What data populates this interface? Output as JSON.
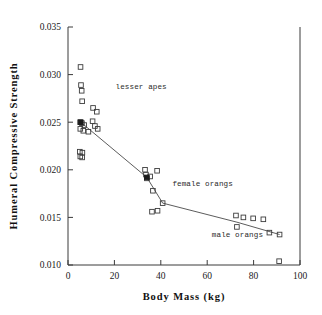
{
  "chart_data": {
    "type": "scatter",
    "title": "",
    "xlabel": "Body Mass (kg)",
    "ylabel": "Humeral Compressive Strength",
    "xlim": [
      0,
      100
    ],
    "ylim": [
      0.01,
      0.035
    ],
    "xticks": [
      0,
      20,
      40,
      60,
      80,
      100
    ],
    "yticks": [
      0.01,
      0.015,
      0.02,
      0.025,
      0.03,
      0.035
    ],
    "xticklabels": [
      "0",
      "20",
      "40",
      "60",
      "80",
      "100"
    ],
    "yticklabels": [
      "0.010",
      "0.015",
      "0.020",
      "0.025",
      "0.030",
      "0.035"
    ],
    "grid": false,
    "legend": null,
    "annotations": [
      {
        "text": "lesser apes",
        "x": 20.5,
        "y": 0.0285
      },
      {
        "text": "female orangs",
        "x": 45.0,
        "y": 0.0183
      },
      {
        "text": "male orangs",
        "x": 62.0,
        "y": 0.0129
      }
    ],
    "series": [
      {
        "name": "individual specimens",
        "marker": "open-square",
        "values": [
          [
            5.4,
            0.0308
          ],
          [
            5.6,
            0.0289
          ],
          [
            5.9,
            0.0283
          ],
          [
            6.1,
            0.0272
          ],
          [
            10.8,
            0.0265
          ],
          [
            12.4,
            0.0261
          ],
          [
            10.6,
            0.0251
          ],
          [
            5.2,
            0.025
          ],
          [
            6.0,
            0.0249
          ],
          [
            7.0,
            0.0247
          ],
          [
            11.6,
            0.0246
          ],
          [
            12.8,
            0.0243
          ],
          [
            5.3,
            0.0243
          ],
          [
            6.6,
            0.0241
          ],
          [
            8.8,
            0.024
          ],
          [
            5.1,
            0.0219
          ],
          [
            6.2,
            0.0218
          ],
          [
            5.3,
            0.0214
          ],
          [
            6.1,
            0.0213
          ],
          [
            33.2,
            0.02
          ],
          [
            38.4,
            0.0199
          ],
          [
            33.6,
            0.0195
          ],
          [
            35.4,
            0.0193
          ],
          [
            34.0,
            0.0191
          ],
          [
            36.6,
            0.0178
          ],
          [
            40.8,
            0.0165
          ],
          [
            36.2,
            0.0156
          ],
          [
            38.6,
            0.0157
          ],
          [
            72.4,
            0.0152
          ],
          [
            75.6,
            0.015
          ],
          [
            79.8,
            0.0149
          ],
          [
            84.2,
            0.0148
          ],
          [
            72.8,
            0.014
          ],
          [
            86.8,
            0.0134
          ],
          [
            91.2,
            0.0132
          ],
          [
            91.0,
            0.0104
          ]
        ]
      },
      {
        "name": "group means",
        "marker": "filled-square",
        "values": [
          [
            5.5,
            0.025
          ],
          [
            34.0,
            0.0192
          ]
        ]
      }
    ],
    "trend_line": {
      "name": "connecting trend",
      "points": [
        [
          5.5,
          0.025
        ],
        [
          34.0,
          0.0192
        ],
        [
          40.8,
          0.0165
        ],
        [
          72.8,
          0.0145
        ],
        [
          91.2,
          0.0132
        ]
      ]
    }
  }
}
